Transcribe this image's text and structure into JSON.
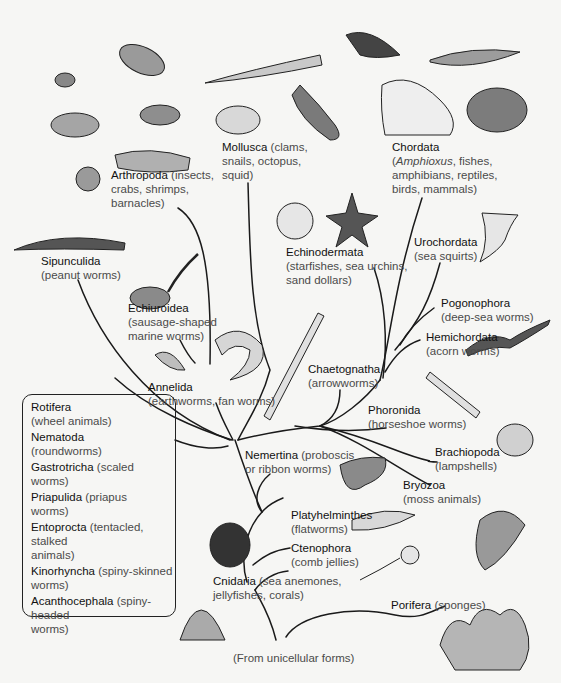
{
  "figure": {
    "type": "phylogenetic-tree",
    "root": "(From unicellular forms)",
    "phyla": [
      {
        "name": "Arthropoda",
        "desc": "(insects,",
        "desc2": "crabs, shrimps,",
        "desc3": "barnacles)"
      },
      {
        "name": "Mollusca",
        "desc": "(clams,",
        "desc2": "snails, octopus,",
        "desc3": "squid)"
      },
      {
        "name": "Chordata",
        "desc_pre": "(",
        "desc_italic": "Amphioxus",
        "desc": ", fishes,",
        "desc2": "amphibians, reptiles,",
        "desc3": "birds, mammals)"
      },
      {
        "name": "Sipunculida",
        "desc": "(peanut worms)"
      },
      {
        "name": "Echiuroidea",
        "desc": "(sausage-shaped",
        "desc2": "marine worms)"
      },
      {
        "name": "Echinodermata",
        "desc": "(starfishes, sea urchins,",
        "desc2": "sand dollars)"
      },
      {
        "name": "Urochordata",
        "desc": "(sea squirts)"
      },
      {
        "name": "Pogonophora",
        "desc": "(deep-sea worms)"
      },
      {
        "name": "Hemichordata",
        "desc": "(acorn worms)"
      },
      {
        "name": "Annelida",
        "desc": "(earthworms, fan worms)"
      },
      {
        "name": "Chaetognatha",
        "desc": "(arrowworms)"
      },
      {
        "name": "Phoronida",
        "desc": "(horseshoe worms)"
      },
      {
        "name": "Nemertina",
        "desc": "(proboscis",
        "desc2": "or ribbon worms)"
      },
      {
        "name": "Brachiopoda",
        "desc": "(lampshells)"
      },
      {
        "name": "Bryozoa",
        "desc": "(moss animals)"
      },
      {
        "name": "Platyhelminthes",
        "desc": "(flatworms)"
      },
      {
        "name": "Ctenophora",
        "desc": "(comb jellies)"
      },
      {
        "name": "Cnidaria",
        "desc": "(sea anemones,",
        "desc2": "jellyfishes, corals)"
      },
      {
        "name": "Porifera",
        "desc": "(sponges)"
      }
    ],
    "boxed_group": [
      {
        "name": "Rotifera",
        "desc": "(wheel animals)"
      },
      {
        "name": "Nematoda",
        "desc": "(roundworms)"
      },
      {
        "name": "Gastrotricha",
        "desc": "(scaled",
        "desc2": "worms)"
      },
      {
        "name": "Priapulida",
        "desc": "(priapus",
        "desc2": "worms)"
      },
      {
        "name": "Entoprocta",
        "desc": "(tentacled, stalked",
        "desc2": "animals)"
      },
      {
        "name": "Kinorhyncha",
        "desc": "(spiny-skinned",
        "desc2": "worms)"
      },
      {
        "name": "Acanthocephala",
        "desc": "(spiny-headed",
        "desc2": "worms)"
      }
    ]
  }
}
